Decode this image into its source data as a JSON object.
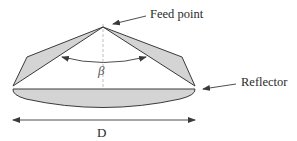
{
  "diagram": {
    "type": "antenna-geometry",
    "labels": {
      "feed_point": "Feed point",
      "reflector": "Reflector",
      "angle": "β",
      "diameter": "D"
    },
    "colors": {
      "stroke": "#3a3a3a",
      "fill": "#d4d4d4",
      "dashed_axis": "#b0b0b0",
      "background": "#ffffff"
    }
  }
}
